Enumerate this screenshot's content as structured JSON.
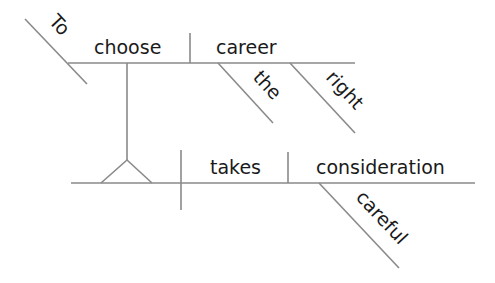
{
  "diagram": {
    "type": "sentence-diagram",
    "sentence": "To choose the right career takes careful consideration",
    "colors": {
      "line": "#8a8a8a",
      "text": "#1a1a1a",
      "background": "#ffffff"
    },
    "infinitive_phrase": {
      "preposition": "To",
      "verb": "choose",
      "object": "career",
      "modifiers": [
        "the",
        "right"
      ]
    },
    "main_clause": {
      "predicate": "takes",
      "object": "consideration",
      "modifier": "careful"
    }
  }
}
